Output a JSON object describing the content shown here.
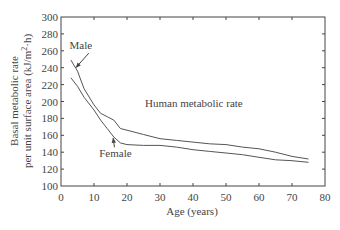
{
  "chart_data": {
    "type": "line",
    "title": "",
    "annotation": "Human metabolic rate",
    "xlabel": "Age (years)",
    "ylabel_line1": "Basal metabolic rate",
    "ylabel_line2": "per unit surface area (kJ/m²·h)",
    "xlim": [
      0,
      80
    ],
    "ylim": [
      100,
      300
    ],
    "xticks": [
      0,
      10,
      20,
      30,
      40,
      50,
      60,
      70,
      80
    ],
    "yticks": [
      100,
      120,
      140,
      160,
      180,
      200,
      220,
      240,
      260,
      280,
      300
    ],
    "grid": false,
    "legend": "none (inline arrow labels)",
    "series": [
      {
        "name": "Male",
        "x": [
          3,
          5,
          7,
          10,
          12,
          14,
          16,
          18,
          20,
          25,
          30,
          35,
          40,
          45,
          50,
          55,
          60,
          65,
          70,
          75
        ],
        "values": [
          249,
          236,
          215,
          196,
          186,
          182,
          178,
          168,
          166,
          161,
          156,
          154,
          152,
          150,
          149,
          146,
          144,
          140,
          135,
          132
        ],
        "label_pos": {
          "x": 6,
          "y": 262
        },
        "arrow_to": {
          "x": 4.5,
          "y": 240
        }
      },
      {
        "name": "Female",
        "x": [
          3,
          5,
          7,
          10,
          12,
          14,
          16,
          18,
          20,
          25,
          30,
          35,
          40,
          45,
          50,
          55,
          60,
          65,
          70,
          75
        ],
        "values": [
          228,
          218,
          205,
          190,
          178,
          168,
          158,
          151,
          149,
          148,
          148,
          146,
          143,
          141,
          139,
          137,
          134,
          131,
          130,
          128
        ],
        "label_pos": {
          "x": 16.5,
          "y": 134
        },
        "arrow_to": {
          "x": 15.8,
          "y": 157
        }
      }
    ],
    "colors": {
      "line": "#555555",
      "axis": "#444444",
      "text": "#444444"
    }
  }
}
